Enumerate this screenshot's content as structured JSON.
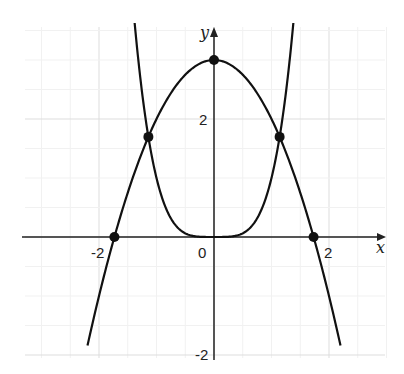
{
  "chart_data": {
    "type": "line",
    "title": "",
    "xlabel": "x",
    "ylabel": "y",
    "xlim": [
      -3.35,
      3.0
    ],
    "ylim": [
      -2.05,
      3.55
    ],
    "grid": true,
    "major_ticks": {
      "x": [
        -2,
        0,
        2
      ],
      "y": [
        -2,
        2
      ]
    },
    "tick_labels": {
      "x": [
        "-2",
        "0",
        "2"
      ],
      "y": [
        "2",
        "-2"
      ]
    },
    "series": [
      {
        "name": "y = 3 - x^2",
        "kind": "parabola",
        "x_range": [
          -2.2,
          2.2
        ]
      },
      {
        "name": "y = x^4",
        "kind": "quartic",
        "x_range": [
          -1.38,
          1.38
        ]
      }
    ],
    "points": [
      {
        "x": 0,
        "y": 3,
        "label": "vertex"
      },
      {
        "x": -1.732,
        "y": 0,
        "label": "x-intercept"
      },
      {
        "x": 1.732,
        "y": 0,
        "label": "x-intercept"
      },
      {
        "x": -1.141,
        "y": 1.697,
        "label": "intersection"
      },
      {
        "x": 1.141,
        "y": 1.697,
        "label": "intersection"
      }
    ],
    "legend": null
  },
  "labels": {
    "x_axis": "x",
    "y_axis": "y",
    "x_ticks": [
      "-2",
      "0",
      "2"
    ],
    "y_tick_pos": "2",
    "y_tick_neg": "-2"
  },
  "colors": {
    "curve": "#111111",
    "grid": "#e6e6e6",
    "axis": "#222222"
  }
}
